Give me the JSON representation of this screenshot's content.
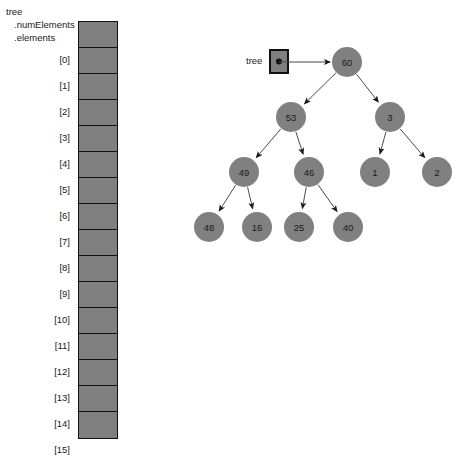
{
  "struct": {
    "name": "tree",
    "field_num_elements": ".numElements",
    "field_elements": ".elements",
    "cell_count": 16,
    "indices": [
      "[0]",
      "[1]",
      "[2]",
      "[3]",
      "[4]",
      "[5]",
      "[6]",
      "[7]",
      "[8]",
      "[9]",
      "[10]",
      "[11]",
      "[12]",
      "[13]",
      "[14]",
      "[15]"
    ],
    "cell_fill": "#808080",
    "cell_border": "#111111"
  },
  "tree": {
    "pointer_label": "tree",
    "node_fill": "#808080",
    "edge_color": "#4a4a4a",
    "nodes": [
      {
        "id": "n60",
        "label": "60",
        "cx": 187,
        "cy": 62,
        "r": 15
      },
      {
        "id": "n53",
        "label": "53",
        "cx": 131,
        "cy": 117,
        "r": 15
      },
      {
        "id": "n3",
        "label": "3",
        "cx": 230,
        "cy": 117,
        "r": 15
      },
      {
        "id": "n49",
        "label": "49",
        "cx": 84,
        "cy": 172,
        "r": 15
      },
      {
        "id": "n46",
        "label": "46",
        "cx": 149,
        "cy": 172,
        "r": 15
      },
      {
        "id": "n1",
        "label": "1",
        "cx": 215,
        "cy": 172,
        "r": 15
      },
      {
        "id": "n2",
        "label": "2",
        "cx": 277,
        "cy": 172,
        "r": 15
      },
      {
        "id": "n48",
        "label": "48",
        "cx": 49,
        "cy": 227,
        "r": 15
      },
      {
        "id": "n16",
        "label": "16",
        "cx": 97,
        "cy": 227,
        "r": 15
      },
      {
        "id": "n25",
        "label": "25",
        "cx": 139,
        "cy": 227,
        "r": 15
      },
      {
        "id": "n40",
        "label": "40",
        "cx": 188,
        "cy": 227,
        "r": 15
      }
    ],
    "edges": [
      {
        "from": "n60",
        "to": "n53"
      },
      {
        "from": "n60",
        "to": "n3"
      },
      {
        "from": "n53",
        "to": "n49"
      },
      {
        "from": "n53",
        "to": "n46"
      },
      {
        "from": "n3",
        "to": "n1"
      },
      {
        "from": "n3",
        "to": "n2"
      },
      {
        "from": "n49",
        "to": "n48"
      },
      {
        "from": "n49",
        "to": "n16"
      },
      {
        "from": "n46",
        "to": "n25"
      },
      {
        "from": "n46",
        "to": "n40"
      }
    ],
    "pointer": {
      "box_x": 110,
      "box_y": 50,
      "box_w": 18,
      "box_h": 23,
      "arrow_from_x": 128,
      "arrow_to_x": 170,
      "arrow_y": 62
    }
  }
}
